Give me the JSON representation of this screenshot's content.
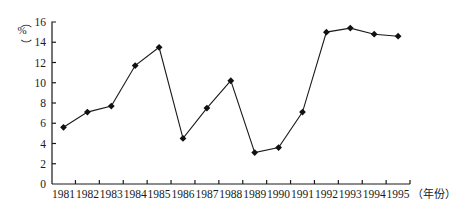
{
  "chart_data": {
    "type": "line",
    "title": "",
    "xlabel": "（年份）",
    "ylabel": "（%）",
    "ylim": [
      0,
      16
    ],
    "yticks": [
      0,
      2,
      4,
      6,
      8,
      10,
      12,
      14,
      16
    ],
    "grid": false,
    "legend": null,
    "marker": "diamond",
    "categories": [
      "1981",
      "1982",
      "1983",
      "1984",
      "1985",
      "1986",
      "1987",
      "1988",
      "1989",
      "1990",
      "1991",
      "1992",
      "1993",
      "1994",
      "1995"
    ],
    "series": [
      {
        "name": "",
        "values": [
          5.6,
          7.1,
          7.7,
          11.7,
          13.5,
          4.5,
          7.5,
          10.2,
          3.1,
          3.6,
          7.1,
          15.0,
          15.4,
          14.8,
          14.6
        ]
      }
    ]
  },
  "colors": {
    "line": "#1a1a1a",
    "marker": "#111111",
    "background": "#ffffff"
  }
}
